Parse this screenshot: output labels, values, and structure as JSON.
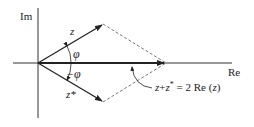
{
  "diagram": {
    "axes": {
      "imag_label": "Im",
      "real_label": "Re"
    },
    "vectors": [
      {
        "name": "z",
        "label": "z",
        "from": [
          38,
          63
        ],
        "to": [
          103,
          24
        ]
      },
      {
        "name": "z-conjugate",
        "label": "z*",
        "from": [
          38,
          63
        ],
        "to": [
          103,
          102
        ]
      },
      {
        "name": "sum",
        "label": "z + z* = 2 Re (z)",
        "from": [
          38,
          63
        ],
        "to": [
          166,
          63
        ]
      }
    ],
    "angles": {
      "upper": "φ",
      "lower": "−φ"
    },
    "annotation": "z + z* = 2 Re (z)",
    "colors": {
      "line": "#222222",
      "dashed": "#555555",
      "background": "#ffffff"
    }
  }
}
